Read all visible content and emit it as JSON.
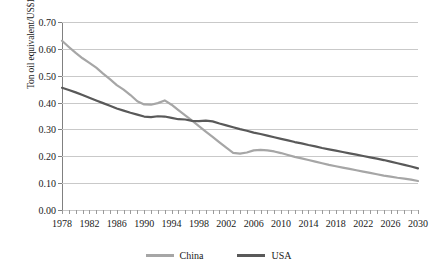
{
  "chart_data": {
    "type": "line",
    "title": "",
    "xlabel": "",
    "ylabel": "Ton oil equivalent/US$1000, 1990",
    "xlim": [
      1978,
      2030
    ],
    "ylim": [
      0.0,
      0.7
    ],
    "ytick_labels": [
      "0.70",
      "0.60",
      "0.50",
      "0.40",
      "0.30",
      "0.20",
      "0.10",
      "0.00"
    ],
    "ytick_values": [
      0.7,
      0.6,
      0.5,
      0.4,
      0.3,
      0.2,
      0.1,
      0.0
    ],
    "xtick_labels": [
      "1978",
      "1982",
      "1986",
      "1990",
      "1994",
      "1998",
      "2002",
      "2006",
      "2010",
      "2014",
      "2018",
      "2022",
      "2026",
      "2030"
    ],
    "xtick_values": [
      1978,
      1982,
      1986,
      1990,
      1994,
      1998,
      2002,
      2006,
      2010,
      2014,
      2018,
      2022,
      2026,
      2030
    ],
    "x": [
      1978,
      1979,
      1980,
      1981,
      1982,
      1983,
      1984,
      1985,
      1986,
      1987,
      1988,
      1989,
      1990,
      1991,
      1992,
      1993,
      1994,
      1995,
      1996,
      1997,
      1998,
      1999,
      2000,
      2001,
      2002,
      2003,
      2004,
      2005,
      2006,
      2007,
      2008,
      2009,
      2010,
      2011,
      2012,
      2013,
      2014,
      2015,
      2016,
      2017,
      2018,
      2019,
      2020,
      2021,
      2022,
      2023,
      2024,
      2025,
      2026,
      2027,
      2028,
      2029,
      2030
    ],
    "grid": true,
    "legend_position": "bottom",
    "series": [
      {
        "name": "China",
        "color": "#a6a6a6",
        "values": [
          0.63,
          0.607,
          0.585,
          0.565,
          0.548,
          0.53,
          0.508,
          0.487,
          0.465,
          0.448,
          0.428,
          0.405,
          0.393,
          0.392,
          0.398,
          0.408,
          0.392,
          0.372,
          0.352,
          0.333,
          0.312,
          0.292,
          0.272,
          0.252,
          0.232,
          0.213,
          0.21,
          0.214,
          0.222,
          0.224,
          0.222,
          0.218,
          0.212,
          0.205,
          0.198,
          0.192,
          0.186,
          0.18,
          0.174,
          0.168,
          0.163,
          0.158,
          0.153,
          0.148,
          0.143,
          0.138,
          0.133,
          0.128,
          0.124,
          0.12,
          0.117,
          0.113,
          0.108
        ]
      },
      {
        "name": "USA",
        "color": "#595959",
        "values": [
          0.455,
          0.447,
          0.438,
          0.428,
          0.418,
          0.408,
          0.398,
          0.388,
          0.378,
          0.37,
          0.362,
          0.355,
          0.348,
          0.346,
          0.349,
          0.348,
          0.343,
          0.338,
          0.337,
          0.332,
          0.331,
          0.333,
          0.33,
          0.322,
          0.315,
          0.308,
          0.301,
          0.295,
          0.288,
          0.283,
          0.277,
          0.271,
          0.265,
          0.259,
          0.253,
          0.248,
          0.242,
          0.237,
          0.231,
          0.226,
          0.221,
          0.216,
          0.211,
          0.206,
          0.201,
          0.196,
          0.191,
          0.186,
          0.18,
          0.174,
          0.168,
          0.162,
          0.155
        ]
      }
    ]
  },
  "legend": {
    "items": [
      {
        "label": "China",
        "color": "#a6a6a6"
      },
      {
        "label": "USA",
        "color": "#595959"
      }
    ]
  }
}
